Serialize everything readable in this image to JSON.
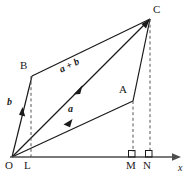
{
  "figure": {
    "colors": {
      "stroke": "#1a1a1a",
      "dashed": "#555555",
      "axis": "#4d4d4d",
      "background": "#ffffff"
    },
    "axis": {
      "name": "x-axis",
      "label": "x",
      "label_x": 179,
      "label_y": 166,
      "start_x": 10,
      "end_x": 180,
      "y": 157
    },
    "vertices": [
      {
        "id": "O",
        "label": "O",
        "px": 12,
        "py": 157,
        "label_x": 6,
        "label_y": 161
      },
      {
        "id": "L",
        "label": "L",
        "px": 30,
        "py": 157,
        "label_x": 25,
        "label_y": 161
      },
      {
        "id": "B",
        "label": "B",
        "px": 32,
        "py": 76,
        "label_x": 20,
        "label_y": 62
      },
      {
        "id": "A",
        "label": "A",
        "px": 133,
        "py": 101,
        "label_x": 119,
        "label_y": 86
      },
      {
        "id": "C",
        "label": "C",
        "px": 150,
        "py": 19,
        "label_x": 154,
        "label_y": 6
      },
      {
        "id": "M",
        "label": "M",
        "px": 133,
        "py": 157,
        "label_x": 128,
        "label_y": 161
      },
      {
        "id": "N",
        "label": "N",
        "px": 150,
        "py": 157,
        "label_x": 145,
        "label_y": 161
      }
    ],
    "vectors": [
      {
        "id": "a",
        "label": "a",
        "from": "O",
        "to": "A",
        "label_x": 69,
        "label_y": 107
      },
      {
        "id": "b",
        "label": "b",
        "from": "O",
        "to": "B",
        "label_x": 8,
        "label_y": 100
      },
      {
        "id": "a_plus_b",
        "label": "a + b",
        "from": "O",
        "to": "C",
        "label_x": 62,
        "label_y": 68
      }
    ],
    "dashed_drops": [
      {
        "id": "B-to-L",
        "x": 31,
        "y_top": 76,
        "y_bottom": 157
      },
      {
        "id": "A-to-M",
        "x": 133,
        "y_top": 101,
        "y_bottom": 157
      },
      {
        "id": "C-to-N",
        "x": 150,
        "y_top": 19,
        "y_bottom": 157
      }
    ],
    "right_angle_marks": [
      {
        "id": "right-angle-at-M",
        "x": 134,
        "y": 150
      },
      {
        "id": "right-angle-at-N",
        "x": 151,
        "y": 150
      }
    ],
    "edges": [
      {
        "id": "O-B",
        "from": "O",
        "to": "B"
      },
      {
        "id": "B-C",
        "from": "B",
        "to": "C"
      },
      {
        "id": "O-A",
        "from": "O",
        "to": "A"
      },
      {
        "id": "A-C",
        "from": "A",
        "to": "C"
      },
      {
        "id": "O-C",
        "from": "O",
        "to": "C"
      }
    ]
  }
}
